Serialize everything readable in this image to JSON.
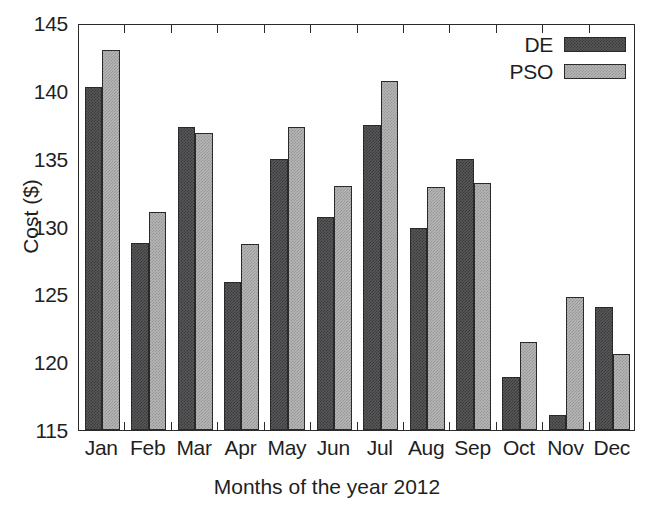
{
  "chart_data": {
    "type": "bar",
    "title": "",
    "xlabel": "Months of the year 2012",
    "ylabel": "Cost ($)",
    "categories": [
      "Jan",
      "Feb",
      "Mar",
      "Apr",
      "May",
      "Jun",
      "Jul",
      "Aug",
      "Sep",
      "Oct",
      "Nov",
      "Dec"
    ],
    "series": [
      {
        "name": "DE",
        "color": "#58585a",
        "values": [
          140.3,
          128.8,
          137.3,
          125.9,
          135.0,
          130.7,
          137.5,
          129.9,
          135.0,
          118.9,
          116.1,
          124.1
        ]
      },
      {
        "name": "PSO",
        "color": "#b5b5b5",
        "values": [
          143.0,
          131.1,
          136.9,
          128.7,
          137.3,
          133.0,
          140.7,
          132.9,
          133.2,
          121.5,
          124.8,
          120.6
        ]
      }
    ],
    "ylim": [
      115,
      145
    ],
    "yticks": [
      115,
      120,
      125,
      130,
      135,
      140,
      145
    ],
    "ytick_labels": [
      "115",
      "120",
      "125",
      "130",
      "135",
      "140",
      "145"
    ],
    "grid": false,
    "legend_position": "top-right"
  }
}
